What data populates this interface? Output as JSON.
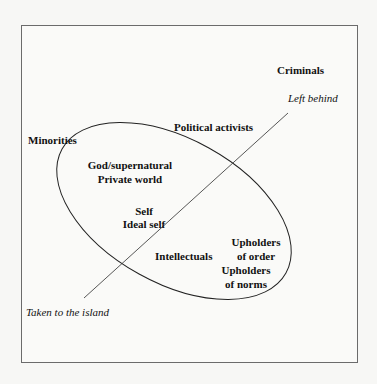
{
  "diagram": {
    "axis": {
      "top_label": "Left behind",
      "bottom_label": "Taken to the island"
    },
    "labels": {
      "criminals": "Criminals",
      "political_activists": "Political activists",
      "minorities": "Minorities",
      "god": "God/supernatural",
      "private_world": "Private world",
      "self": "Self",
      "ideal_self": "Ideal self",
      "intellectuals": "Intellectuals",
      "upholders_order_1": "Upholders",
      "upholders_order_2": "of order",
      "upholders_norms_1": "Upholders",
      "upholders_norms_2": "of norms"
    },
    "colors": {
      "stroke": "#222222",
      "frame": "#6b6b6b"
    }
  }
}
